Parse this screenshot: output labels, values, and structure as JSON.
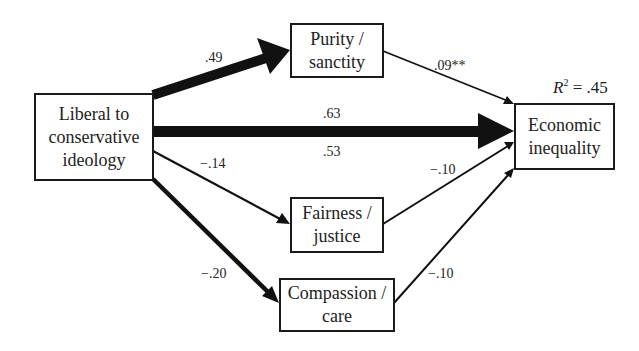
{
  "diagram": {
    "type": "path-model",
    "nodes": {
      "ideology": {
        "line1": "Liberal to",
        "line2": "conservative",
        "line3": "ideology"
      },
      "purity": {
        "line1": "Purity /",
        "line2": "sanctity"
      },
      "fairness": {
        "line1": "Fairness /",
        "line2": "justice"
      },
      "compassion": {
        "line1": "Compassion /",
        "line2": "care"
      },
      "inequality": {
        "line1": "Economic",
        "line2": "inequality"
      }
    },
    "edges": [
      {
        "from": "ideology",
        "to": "purity",
        "coefficient": ".49"
      },
      {
        "from": "ideology",
        "to": "inequality",
        "coefficient_total": ".63",
        "coefficient_direct": ".53"
      },
      {
        "from": "ideology",
        "to": "fairness",
        "coefficient": "−.14"
      },
      {
        "from": "ideology",
        "to": "compassion",
        "coefficient": "−.20"
      },
      {
        "from": "purity",
        "to": "inequality",
        "coefficient": ".09**"
      },
      {
        "from": "fairness",
        "to": "inequality",
        "coefficient": "−.10"
      },
      {
        "from": "compassion",
        "to": "inequality",
        "coefficient": "−.10"
      }
    ],
    "labels": {
      "ideology_purity": ".49",
      "purity_inequality": ".09**",
      "ideology_inequality_total": ".63",
      "ideology_inequality_direct": ".53",
      "ideology_fairness": "−.14",
      "fairness_inequality": "−.10",
      "ideology_compassion": "−.20",
      "compassion_inequality": "−.10"
    },
    "r_squared": {
      "symbol": "R",
      "exponent": "2",
      "value": " = .45"
    }
  }
}
